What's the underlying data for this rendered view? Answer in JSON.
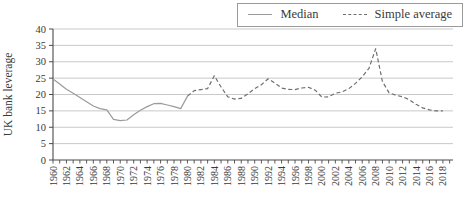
{
  "figure": {
    "ylabel": "UK bank leverage"
  },
  "legend": {
    "items": [
      {
        "label": "Median",
        "style": "solid"
      },
      {
        "label": "Simple average",
        "style": "dashed"
      }
    ]
  },
  "colors": {
    "median_line": "#9b9b9b",
    "average_line": "#6f6f6f",
    "gridline": "#c9c9c9",
    "axis": "#4a4a4a",
    "text": "#3a3a3a",
    "legend_border": "#9b9b9b"
  },
  "chart_data": {
    "type": "line",
    "title": "",
    "xlabel": "",
    "ylabel": "UK bank leverage",
    "ylim": [
      0,
      40
    ],
    "xlim": [
      1960,
      2019
    ],
    "y_ticks": [
      0,
      5,
      10,
      15,
      20,
      25,
      30,
      35,
      40
    ],
    "x_tick_labels": [
      "1960",
      "1962",
      "1964",
      "1966",
      "1968",
      "1970",
      "1972",
      "1974",
      "1976",
      "1978",
      "1980",
      "1982",
      "1984",
      "1986",
      "1988",
      "1990",
      "1992",
      "1994",
      "1996",
      "1998",
      "2000",
      "2002",
      "2004",
      "2006",
      "2008",
      "2010",
      "2012",
      "2014",
      "2016",
      "2018"
    ],
    "grid": "horizontal-only",
    "legend_position": "top-right",
    "series": [
      {
        "name": "Median",
        "style": "solid",
        "x": [
          1960,
          1961,
          1962,
          1963,
          1964,
          1965,
          1966,
          1967,
          1968,
          1969,
          1970,
          1971,
          1972,
          1973,
          1974,
          1975,
          1976,
          1977,
          1978,
          1979,
          1980
        ],
        "values": [
          24.7,
          23.2,
          21.6,
          20.4,
          19.1,
          17.8,
          16.5,
          15.7,
          15.3,
          12.4,
          12.0,
          12.2,
          13.8,
          15.2,
          16.3,
          17.2,
          17.3,
          16.8,
          16.3,
          15.7,
          19.5
        ]
      },
      {
        "name": "Simple average",
        "style": "dashed",
        "x": [
          1980,
          1981,
          1982,
          1983,
          1984,
          1985,
          1986,
          1987,
          1988,
          1989,
          1990,
          1991,
          1992,
          1993,
          1994,
          1995,
          1996,
          1997,
          1998,
          1999,
          2000,
          2001,
          2002,
          2003,
          2004,
          2005,
          2006,
          2007,
          2008,
          2009,
          2010,
          2011,
          2012,
          2013,
          2014,
          2015,
          2016,
          2017,
          2018
        ],
        "values": [
          19.5,
          21.2,
          21.5,
          21.8,
          25.7,
          22.3,
          19.3,
          18.6,
          18.8,
          20.2,
          21.8,
          23.0,
          24.8,
          23.5,
          22.0,
          21.6,
          21.5,
          22.0,
          22.2,
          21.3,
          19.2,
          19.3,
          20.4,
          20.8,
          21.8,
          23.4,
          25.4,
          28.0,
          34.0,
          24.0,
          20.5,
          19.8,
          19.3,
          18.4,
          17.0,
          15.9,
          15.3,
          15.0,
          15.0
        ]
      }
    ]
  }
}
